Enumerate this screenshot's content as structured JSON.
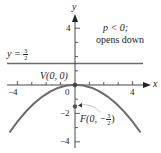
{
  "figure": {
    "type": "parabola-diagram",
    "axes": {
      "x_label": "x",
      "y_label": "y"
    },
    "x_ticks": [
      -4,
      0,
      4
    ],
    "x_tick_labels": {
      "neg4": "−4",
      "zero": "0",
      "pos4": "4"
    },
    "y_tick_labels": {
      "pos4": "4",
      "neg2": "−2",
      "neg4": "−4"
    },
    "annotation": {
      "line1": "p < 0;",
      "line2": "opens down"
    },
    "directrix": {
      "label_lhs": "y =",
      "frac_num": "3",
      "frac_den": "2",
      "value": 1.5
    },
    "vertex": {
      "label": "V(0, 0)",
      "x": 0,
      "y": 0
    },
    "focus": {
      "label_prefix": "F(0, −",
      "frac_num": "3",
      "frac_den": "2",
      "label_suffix": ")",
      "x": 0,
      "y": -1.5
    },
    "curve": {
      "equation": "x^2 = -6y",
      "color": "#6b6b6b"
    },
    "colors": {
      "axis": "#333333",
      "directrix": "#6b6b6b",
      "curve": "#6b6b6b",
      "point": "#555555",
      "arrow": "#bbbbbb"
    }
  }
}
